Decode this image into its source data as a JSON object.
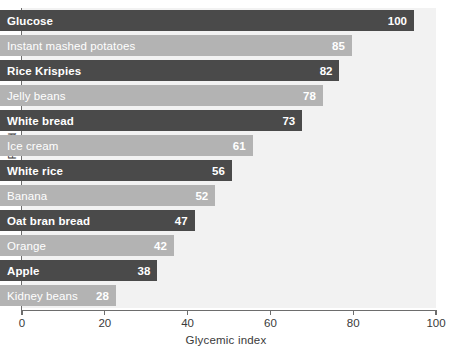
{
  "chart_data": {
    "type": "bar",
    "orientation": "horizontal",
    "title": "",
    "xlabel": "Glycemic index",
    "ylabel": "Food",
    "xlim": [
      0,
      100
    ],
    "xticks": [
      0,
      20,
      40,
      60,
      80,
      100
    ],
    "grid": false,
    "legend": null,
    "categories": [
      "Glucose",
      "Instant mashed potatoes",
      "Rice Krispies",
      "Jelly beans",
      "White bread",
      "Ice cream",
      "White rice",
      "Banana",
      "Oat bran bread",
      "Orange",
      "Apple",
      "Kidney beans"
    ],
    "values": [
      100,
      85,
      82,
      78,
      73,
      61,
      56,
      52,
      47,
      42,
      38,
      28
    ],
    "bar_styles": [
      "dark",
      "light",
      "dark",
      "light",
      "dark",
      "light",
      "dark",
      "light",
      "dark",
      "light",
      "dark",
      "light"
    ]
  },
  "colors": {
    "bar_dark": "#4a4a4a",
    "bar_light": "#b3b3b3",
    "plot_background": "#f2f2f2",
    "axis": "#6d6d6d",
    "value_text": "#ffffff",
    "axis_text": "#3a3a3a",
    "page_background": "#ffffff"
  }
}
